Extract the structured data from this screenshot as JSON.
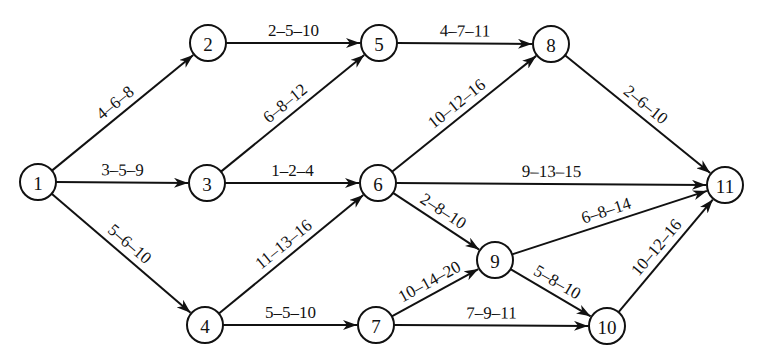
{
  "diagram": {
    "type": "PERT activity network",
    "node_radius": 18,
    "colors": {
      "stroke": "#111111",
      "background": "#ffffff",
      "text": "#111111"
    },
    "nodes": [
      {
        "id": "1",
        "label": "1",
        "x": 38,
        "y": 182
      },
      {
        "id": "2",
        "label": "2",
        "x": 208,
        "y": 43
      },
      {
        "id": "3",
        "label": "3",
        "x": 207,
        "y": 183
      },
      {
        "id": "4",
        "label": "4",
        "x": 205,
        "y": 325
      },
      {
        "id": "5",
        "label": "5",
        "x": 379,
        "y": 43
      },
      {
        "id": "6",
        "label": "6",
        "x": 378,
        "y": 183
      },
      {
        "id": "7",
        "label": "7",
        "x": 376,
        "y": 325
      },
      {
        "id": "8",
        "label": "8",
        "x": 551,
        "y": 44
      },
      {
        "id": "9",
        "label": "9",
        "x": 495,
        "y": 260
      },
      {
        "id": "10",
        "label": "10",
        "x": 607,
        "y": 326
      },
      {
        "id": "11",
        "label": "11",
        "x": 725,
        "y": 185
      }
    ],
    "edges": [
      {
        "from": "1",
        "to": "2",
        "label": "4–6–8",
        "side": "above"
      },
      {
        "from": "1",
        "to": "3",
        "label": "3–5–9",
        "side": "above"
      },
      {
        "from": "1",
        "to": "4",
        "label": "5–6–10",
        "side": "above"
      },
      {
        "from": "2",
        "to": "5",
        "label": "2–5–10",
        "side": "above"
      },
      {
        "from": "3",
        "to": "5",
        "label": "6–8–12",
        "side": "above"
      },
      {
        "from": "3",
        "to": "6",
        "label": "1–2–4",
        "side": "above"
      },
      {
        "from": "4",
        "to": "6",
        "label": "11–13–16",
        "side": "above"
      },
      {
        "from": "4",
        "to": "7",
        "label": "5–5–10",
        "side": "above"
      },
      {
        "from": "5",
        "to": "8",
        "label": "4–7–11",
        "side": "above"
      },
      {
        "from": "6",
        "to": "8",
        "label": "10–12–16",
        "side": "above"
      },
      {
        "from": "6",
        "to": "11",
        "label": "9–13–15",
        "side": "above"
      },
      {
        "from": "6",
        "to": "9",
        "label": "2–8–10",
        "side": "above"
      },
      {
        "from": "7",
        "to": "9",
        "label": "10–14–20",
        "side": "above"
      },
      {
        "from": "7",
        "to": "10",
        "label": "7–9–11",
        "side": "above"
      },
      {
        "from": "8",
        "to": "11",
        "label": "2–6–10",
        "side": "above"
      },
      {
        "from": "9",
        "to": "11",
        "label": "6–8–14",
        "side": "above"
      },
      {
        "from": "9",
        "to": "10",
        "label": "5–8–10",
        "side": "above"
      },
      {
        "from": "10",
        "to": "11",
        "label": "10–12–16",
        "side": "above"
      }
    ]
  }
}
